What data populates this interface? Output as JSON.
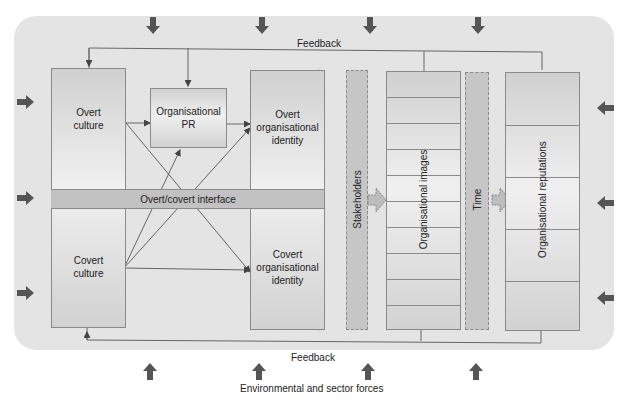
{
  "diagram": {
    "feedback_top": "Feedback",
    "feedback_bottom": "Feedback",
    "caption": "Environmental and sector forces",
    "nodes": {
      "overt_culture": "Overt\nculture",
      "covert_culture": "Covert\nculture",
      "organisational_pr": "Organisational\nPR",
      "overt_identity": "Overt\norganisational\nidentity",
      "covert_identity": "Covert\norganisational\nidentity",
      "interface": "Overt/covert interface",
      "stakeholders": "Stakeholders",
      "images": "Organisational images",
      "time": "Time",
      "reputations": "Organisational reputations"
    },
    "colors": {
      "panel": "#e4e4e4",
      "band": "#c2c2c2",
      "arrow": "#555555",
      "line": "#666666"
    },
    "force_arrows": {
      "top": 4,
      "bottom": 4,
      "left": 3,
      "right": 3
    }
  }
}
